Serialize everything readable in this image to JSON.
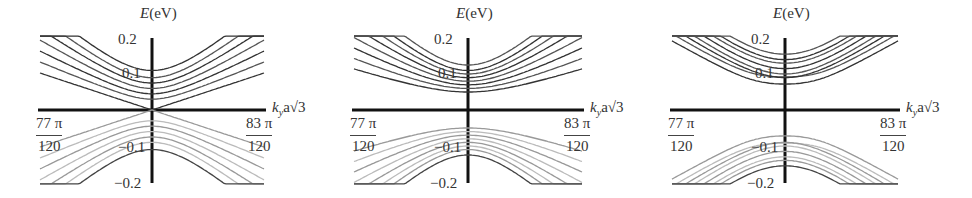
{
  "figure": {
    "panels": [
      {
        "id": "a",
        "gap": "none"
      },
      {
        "id": "b",
        "gap": "small"
      },
      {
        "id": "c",
        "gap": "large"
      }
    ],
    "axis_labels": {
      "y_var": "E",
      "y_unit": "(eV)",
      "x_var": "k",
      "x_sub": "y",
      "x_rest": "a√3",
      "y_ticks": [
        "0.2",
        "0.1",
        "−0.1",
        "−0.2"
      ],
      "x_left_num": "77 π",
      "x_left_den": "120",
      "x_right_num": "83 π",
      "x_right_den": "120"
    }
  },
  "chart_data": [
    {
      "type": "line",
      "title": "",
      "xlabel": "k_y a√3",
      "ylabel": "E(eV)",
      "xlim": [
        "77π/120",
        "83π/120"
      ],
      "ylim": [
        -0.2,
        0.2
      ],
      "y_ticks": [
        -0.2,
        -0.1,
        0.1,
        0.2
      ],
      "description": "Massless Dirac-like bands: conduction (dark) and valence (light) hyperbolic subbands meeting at E=0",
      "band_minima_eV": [
        0.0,
        0.03,
        0.045,
        0.06,
        0.075,
        0.09,
        0.11
      ]
    },
    {
      "type": "line",
      "title": "",
      "xlabel": "k_y a√3",
      "ylabel": "E(eV)",
      "xlim": [
        "77π/120",
        "83π/120"
      ],
      "ylim": [
        -0.2,
        0.2
      ],
      "y_ticks": [
        -0.2,
        -0.1,
        0.1,
        0.2
      ],
      "description": "Gapped bands, lowest conduction subband minimum ~0.05 eV",
      "band_minima_eV": [
        0.05,
        0.06,
        0.07,
        0.08,
        0.09,
        0.1,
        0.11,
        0.125
      ]
    },
    {
      "type": "line",
      "title": "",
      "xlabel": "k_y a√3",
      "ylabel": "E(eV)",
      "xlim": [
        "77π/120",
        "83π/120"
      ],
      "ylim": [
        -0.2,
        0.2
      ],
      "y_ticks": [
        -0.2,
        -0.1,
        0.1,
        0.2
      ],
      "description": "Larger gap with flattened/Mexican-hat bands near k center, minima ~0.06-0.15 eV",
      "band_minima_eV": [
        0.06,
        0.08,
        0.09,
        0.1,
        0.115,
        0.13,
        0.14,
        0.155
      ]
    }
  ]
}
